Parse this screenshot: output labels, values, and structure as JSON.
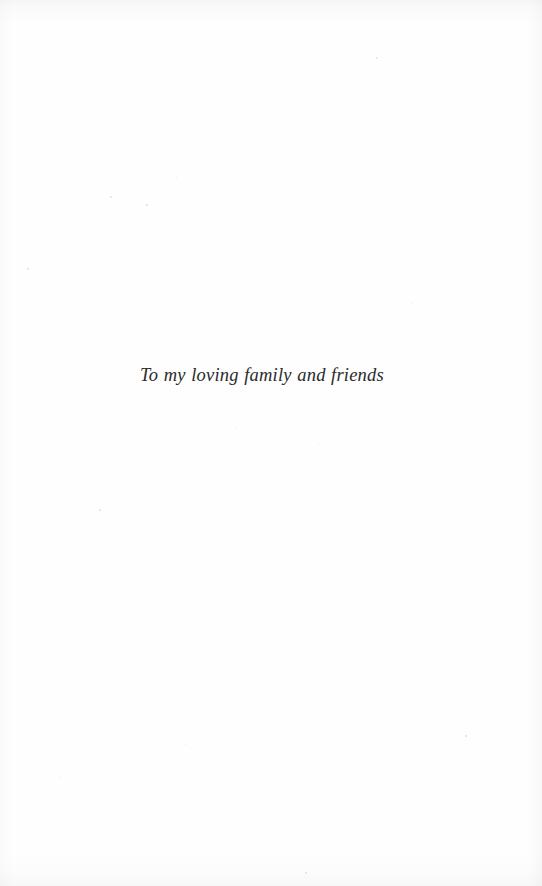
{
  "page": {
    "kind": "book-dedication-page",
    "background_color": "#fefefe",
    "width": 542,
    "height": 886
  },
  "dedication": {
    "text": "To my loving family and friends",
    "style": "italic-serif",
    "ink_color": "#2b2b2b",
    "font_size_px": 18.5,
    "alignment": "center",
    "baseline_y": 385
  },
  "scan_artifacts": {
    "edge_shadows": [
      "top",
      "right",
      "bottom",
      "left"
    ],
    "specks": [
      {
        "x": 110,
        "y": 196,
        "size": 2.2
      },
      {
        "x": 146,
        "y": 204,
        "size": 1.6
      },
      {
        "x": 176,
        "y": 177,
        "size": 1.3
      },
      {
        "x": 27,
        "y": 268,
        "size": 1.5
      },
      {
        "x": 99,
        "y": 509,
        "size": 1.7
      },
      {
        "x": 318,
        "y": 444,
        "size": 1.4
      },
      {
        "x": 236,
        "y": 427,
        "size": 1.2
      },
      {
        "x": 465,
        "y": 735,
        "size": 2.4
      },
      {
        "x": 305,
        "y": 872,
        "size": 2.0
      },
      {
        "x": 497,
        "y": 397,
        "size": 1.3
      },
      {
        "x": 376,
        "y": 57,
        "size": 1.5
      },
      {
        "x": 60,
        "y": 777,
        "size": 1.4
      },
      {
        "x": 185,
        "y": 744,
        "size": 1.2
      },
      {
        "x": 411,
        "y": 303,
        "size": 1.2
      }
    ]
  }
}
